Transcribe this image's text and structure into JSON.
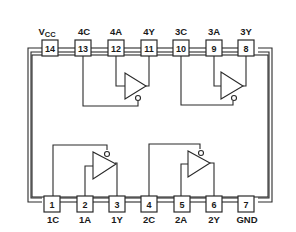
{
  "diagram": {
    "type": "ic-pinout",
    "package": "14-pin DIP",
    "gate_type": "buffer with active-low enable (tri-state)",
    "top_pins": [
      {
        "num": "14",
        "label": "VCC",
        "label_main": "V",
        "label_sub": "CC"
      },
      {
        "num": "13",
        "label": "4C"
      },
      {
        "num": "12",
        "label": "4A"
      },
      {
        "num": "11",
        "label": "4Y"
      },
      {
        "num": "10",
        "label": "3C"
      },
      {
        "num": "9",
        "label": "3A"
      },
      {
        "num": "8",
        "label": "3Y"
      }
    ],
    "bottom_pins": [
      {
        "num": "1",
        "label": "1C"
      },
      {
        "num": "2",
        "label": "1A"
      },
      {
        "num": "3",
        "label": "1Y"
      },
      {
        "num": "4",
        "label": "2C"
      },
      {
        "num": "5",
        "label": "2A"
      },
      {
        "num": "6",
        "label": "2Y"
      },
      {
        "num": "7",
        "label": "GND"
      }
    ],
    "gates": [
      {
        "name": "gate-4",
        "enable": "4C",
        "input": "4A",
        "output": "4Y"
      },
      {
        "name": "gate-3",
        "enable": "3C",
        "input": "3A",
        "output": "3Y"
      },
      {
        "name": "gate-1",
        "enable": "1C",
        "input": "1A",
        "output": "1Y"
      },
      {
        "name": "gate-2",
        "enable": "2C",
        "input": "2A",
        "output": "2Y"
      }
    ],
    "colors": {
      "line": "#2a2a2a",
      "background": "#ffffff"
    }
  }
}
